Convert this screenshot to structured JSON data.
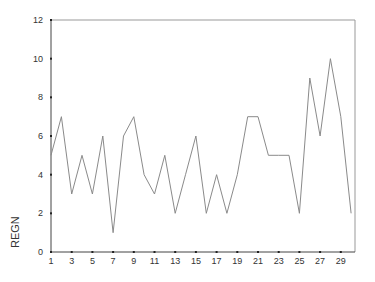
{
  "chart_data": {
    "type": "line",
    "title": "",
    "xlabel": "",
    "ylabel": "REGN",
    "x": [
      1,
      2,
      3,
      4,
      5,
      6,
      7,
      8,
      9,
      10,
      11,
      12,
      13,
      14,
      15,
      16,
      17,
      18,
      19,
      20,
      21,
      22,
      23,
      24,
      25,
      26,
      27,
      28,
      29,
      30
    ],
    "values": [
      5,
      7,
      3,
      5,
      3,
      6,
      1,
      6,
      7,
      4,
      3,
      5,
      2,
      4,
      6,
      2,
      4,
      2,
      4,
      7,
      7,
      5,
      5,
      5,
      2,
      9,
      6,
      10,
      7,
      2
    ],
    "series": [
      {
        "name": "REGN",
        "values": [
          5,
          7,
          3,
          5,
          3,
          6,
          1,
          6,
          7,
          4,
          3,
          5,
          2,
          4,
          6,
          2,
          4,
          2,
          4,
          7,
          7,
          5,
          5,
          5,
          2,
          9,
          6,
          10,
          7,
          2
        ]
      }
    ],
    "x_tick_labels": [
      "1",
      "3",
      "5",
      "7",
      "9",
      "11",
      "13",
      "15",
      "17",
      "19",
      "21",
      "23",
      "25",
      "27",
      "29"
    ],
    "y_tick_labels": [
      "0",
      "2",
      "4",
      "6",
      "8",
      "10",
      "12"
    ],
    "xlim": [
      1,
      30.2
    ],
    "ylim": [
      0,
      12
    ],
    "grid": false,
    "legend": false,
    "line_color": "#8a8a8a"
  }
}
